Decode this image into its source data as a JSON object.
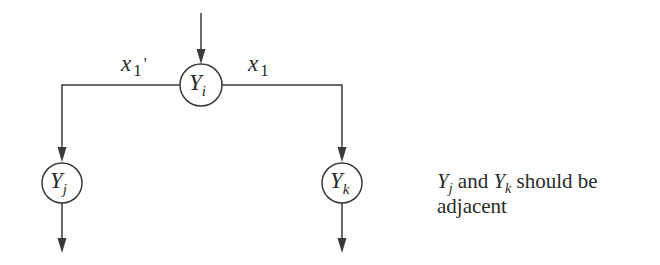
{
  "diagram": {
    "type": "decision-tree-fragment",
    "colors": {
      "stroke": "#3a3a3a",
      "text": "#2a2a2a",
      "background": "#ffffff"
    },
    "nodes": {
      "yi": {
        "var": "Y",
        "sub": "i"
      },
      "yj": {
        "var": "Y",
        "sub": "j"
      },
      "yk": {
        "var": "Y",
        "sub": "k"
      }
    },
    "edges": {
      "left": {
        "var": "x",
        "sub": "1",
        "prime": "'"
      },
      "right": {
        "var": "x",
        "sub": "1"
      }
    },
    "note": {
      "y1_var": "Y",
      "y1_sub": "j",
      "and": " and ",
      "y2_var": "Y",
      "y2_sub": "k",
      "rest": " should be",
      "line2": "adjacent"
    }
  }
}
